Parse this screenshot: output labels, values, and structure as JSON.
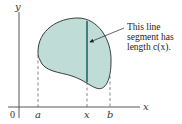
{
  "figure": {
    "axes": {
      "x_label": "x",
      "y_label": "y",
      "origin_label": "0"
    },
    "ticks": [
      {
        "label": "a"
      },
      {
        "label": "x"
      },
      {
        "label": "b"
      }
    ],
    "annotation": {
      "line1": "This line",
      "line2": "segment has",
      "line3": "length c(x)."
    },
    "colors": {
      "region_fill": "#bfdcd6",
      "outline": "#2a2a2a",
      "segment": "#1f6b66"
    }
  }
}
